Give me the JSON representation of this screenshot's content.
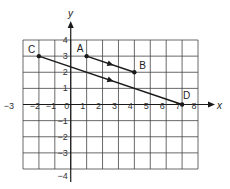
{
  "diagram": {
    "type": "coordinate-grid",
    "x_axis": {
      "label": "x",
      "min": -3,
      "max": 8,
      "ticks": [
        "−3",
        "−2",
        "−1",
        "0",
        "1",
        "2",
        "3",
        "4",
        "5",
        "6",
        "7",
        "8"
      ]
    },
    "y_axis": {
      "label": "y",
      "min": -4,
      "max": 4,
      "ticks": [
        "4",
        "3",
        "2",
        "1",
        "−1",
        "−2",
        "−3",
        "−4"
      ]
    },
    "points": [
      {
        "name": "A",
        "x": 1,
        "y": 3
      },
      {
        "name": "B",
        "x": 4,
        "y": 2
      },
      {
        "name": "C",
        "x": -2,
        "y": 3
      },
      {
        "name": "D",
        "x": 7,
        "y": 0
      }
    ],
    "segments": [
      {
        "from": "A",
        "to": "B",
        "directed": true
      },
      {
        "from": "C",
        "to": "D",
        "directed": true
      }
    ],
    "colors": {
      "grid": "#444444",
      "line": "#1a1a1a",
      "background": "#ffffff"
    }
  }
}
